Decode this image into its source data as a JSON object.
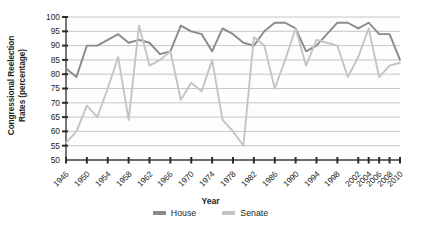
{
  "chart_data": {
    "type": "line",
    "title": "",
    "xlabel": "Year",
    "ylabel_line1": "Congressional Reelection",
    "ylabel_line2": "Rates (percentage)",
    "ylim": [
      50,
      100
    ],
    "ytick_step": 5,
    "yticks": [
      100,
      95,
      90,
      85,
      80,
      75,
      70,
      65,
      60,
      55,
      50
    ],
    "grid": true,
    "grid_color": "#b9b9b9",
    "legend_position": "bottom-center",
    "xticks": [
      "1946",
      "1950",
      "1954",
      "1958",
      "1962",
      "1966",
      "1970",
      "1974",
      "1978",
      "1982",
      "1986",
      "1990",
      "1994",
      "1998",
      "2002",
      "2004",
      "2006",
      "2008",
      "2010"
    ],
    "x": [
      1946,
      1948,
      1950,
      1952,
      1954,
      1956,
      1958,
      1960,
      1962,
      1964,
      1966,
      1968,
      1970,
      1972,
      1974,
      1976,
      1978,
      1980,
      1982,
      1984,
      1986,
      1988,
      1990,
      1992,
      1994,
      1996,
      1998,
      2000,
      2002,
      2004,
      2006,
      2008,
      2010
    ],
    "series": [
      {
        "name": "House",
        "color": "#8a8a8a",
        "values": [
          82,
          79,
          90,
          90,
          92,
          94,
          91,
          92,
          91,
          87,
          88,
          97,
          95,
          94,
          88,
          96,
          94,
          91,
          90,
          95,
          98,
          98,
          96,
          88,
          90,
          94,
          98,
          98,
          96,
          98,
          94,
          94,
          85
        ]
      },
      {
        "name": "Senate",
        "color": "#c4c4c4",
        "values": [
          56,
          60,
          69,
          65,
          75,
          86,
          64,
          97,
          83,
          85,
          88,
          71,
          77,
          74,
          85,
          64,
          60,
          55,
          93,
          90,
          75,
          85,
          96,
          83,
          92,
          91,
          90,
          79,
          86,
          96,
          79,
          83,
          84
        ]
      }
    ]
  }
}
